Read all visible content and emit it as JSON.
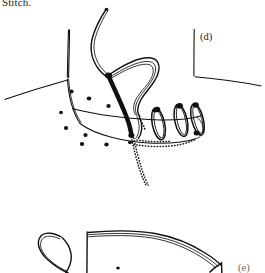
{
  "figure": {
    "type": "line-drawing",
    "background_color": "#ffffff",
    "ink_color": "#101010",
    "caption_top": "Stitch.",
    "panels": [
      {
        "id": "d",
        "label": "(d)",
        "description": "Curved needle with double-strand suture thread passing through tissue edge; three whip-stitch loops encircle the approximated edge; dotted line shows hidden thread tail below the tissue.",
        "elements": [
          "curved-needle",
          "suture-thread-loop",
          "whip-stitch-loops",
          "tissue-edge",
          "stippled-tissue-dots",
          "hidden-thread-dotted"
        ],
        "stitch_loop_count": 3,
        "stipple_dot_count": 11
      },
      {
        "id": "e",
        "label": "(e)",
        "description": "Partially visible lower panel showing thread loop and tissue flap outline, cropped by the bottom of the image.",
        "elements": [
          "thread-loop",
          "tissue-flap-outline"
        ]
      }
    ]
  }
}
